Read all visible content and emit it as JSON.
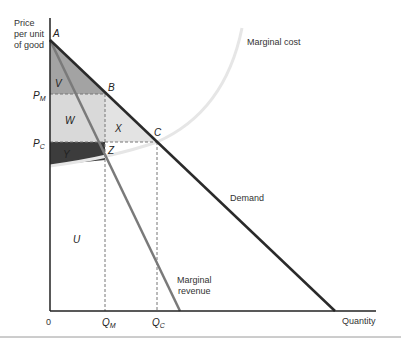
{
  "axes": {
    "y_label_lines": [
      "Price",
      "per unit",
      "of good"
    ],
    "x_label": "Quantity",
    "origin_label": "0"
  },
  "price_ticks": {
    "pm": {
      "main": "P",
      "sub": "M"
    },
    "pc": {
      "main": "P",
      "sub": "C"
    }
  },
  "quantity_ticks": {
    "qm": {
      "main": "Q",
      "sub": "M"
    },
    "qc": {
      "main": "Q",
      "sub": "C"
    }
  },
  "points": {
    "a": "A",
    "b": "B",
    "c": "C",
    "z": "Z"
  },
  "regions": {
    "v": "V",
    "w": "W",
    "x": "X",
    "y": "Y",
    "u": "U"
  },
  "curves": {
    "marginal_cost": "Marginal cost",
    "demand": "Demand",
    "marginal_revenue_lines": [
      "Marginal",
      "revenue"
    ]
  },
  "colors": {
    "region_v": "#a3a3a3",
    "region_w": "#d9d9d9",
    "region_x": "#e3e3e3",
    "region_y": "#3c3c3c",
    "demand_line": "#2a2a2a",
    "mr_line": "#7a7a7a",
    "mc_curve": "#e8e8e8"
  }
}
